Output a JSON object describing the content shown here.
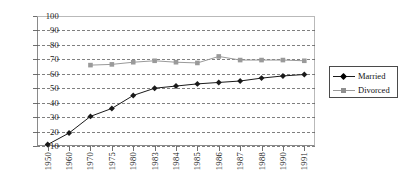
{
  "chart_data": {
    "type": "line",
    "title": "",
    "xlabel": "",
    "ylabel": "",
    "ylim": [
      10,
      100
    ],
    "ytick_step": 10,
    "grid": true,
    "legend_position": "right",
    "categories": [
      "1950",
      "1960",
      "1970",
      "1975",
      "1980",
      "1983",
      "1984",
      "1985",
      "1986",
      "1987",
      "1988",
      "1990",
      "1991"
    ],
    "yticks": [
      "100",
      "90",
      "80",
      "70",
      "60",
      "50",
      "40",
      "30",
      "20",
      "10"
    ],
    "series": [
      {
        "name": "Married",
        "color": "#1a1a1a",
        "marker": "diamond",
        "values": [
          11,
          19,
          30.5,
          36,
          45,
          50,
          51.5,
          53,
          54,
          55,
          57,
          58.5,
          59.5
        ]
      },
      {
        "name": "Divorced",
        "color": "#9a9a9a",
        "marker": "square",
        "values": [
          null,
          null,
          66,
          66.5,
          68,
          69,
          68,
          67.5,
          72,
          69.5,
          69.5,
          69.5,
          69
        ]
      }
    ]
  },
  "legend": {
    "entries": [
      {
        "label": "Married",
        "marker": "diamond-marker",
        "color": "#1a1a1a"
      },
      {
        "label": "Divorced",
        "marker": "square-marker",
        "color": "#9a9a9a"
      }
    ]
  },
  "colors": {
    "married_series": "#1a1a1a",
    "divorced_series": "#9a9a9a",
    "axis": "#6f6f6f",
    "gridline": "#555555",
    "background": "#ffffff"
  }
}
